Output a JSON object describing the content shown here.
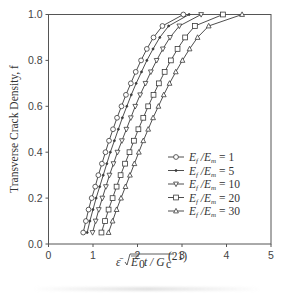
{
  "chart_data": {
    "type": "line",
    "title": "",
    "xlabel": "ε̄ √(Ē₀t / G_c^(21))",
    "ylabel": "Transverse Crack Density, f",
    "xlim": [
      0,
      5
    ],
    "ylim": [
      0.0,
      1.0
    ],
    "x_ticks": [
      "0",
      "1",
      "2",
      "3",
      "4",
      "5"
    ],
    "y_ticks": [
      "0.0",
      "0.2",
      "0.4",
      "0.6",
      "0.8",
      "1.0"
    ],
    "grid": false,
    "legend_position": "lower right (inside)",
    "y": [
      0.05,
      0.1,
      0.15,
      0.2,
      0.25,
      0.3,
      0.35,
      0.4,
      0.45,
      0.5,
      0.55,
      0.6,
      0.65,
      0.7,
      0.75,
      0.8,
      0.85,
      0.9,
      0.95,
      1.0
    ],
    "series": [
      {
        "name": "E_f/E_m = 1",
        "ratio": "1",
        "marker": "circle",
        "x": [
          0.78,
          0.84,
          0.9,
          0.97,
          1.05,
          1.12,
          1.2,
          1.28,
          1.36,
          1.45,
          1.54,
          1.64,
          1.74,
          1.85,
          1.96,
          2.08,
          2.21,
          2.36,
          2.56,
          3.03
        ]
      },
      {
        "name": "E_f/E_m = 5",
        "ratio": "5",
        "marker": "dot",
        "x": [
          0.87,
          0.93,
          1.0,
          1.07,
          1.15,
          1.23,
          1.31,
          1.39,
          1.48,
          1.57,
          1.66,
          1.76,
          1.86,
          1.97,
          2.09,
          2.21,
          2.35,
          2.5,
          2.7,
          3.16
        ]
      },
      {
        "name": "E_f/E_m = 10",
        "ratio": "10",
        "marker": "triangle-down",
        "x": [
          0.99,
          1.06,
          1.13,
          1.21,
          1.29,
          1.37,
          1.46,
          1.55,
          1.65,
          1.75,
          1.85,
          1.95,
          2.06,
          2.18,
          2.3,
          2.43,
          2.57,
          2.73,
          2.94,
          3.43
        ]
      },
      {
        "name": "E_f/E_m = 20",
        "ratio": "20",
        "marker": "square",
        "x": [
          1.19,
          1.27,
          1.35,
          1.44,
          1.53,
          1.62,
          1.72,
          1.82,
          1.92,
          2.02,
          2.13,
          2.24,
          2.36,
          2.48,
          2.61,
          2.75,
          2.9,
          3.07,
          3.29,
          3.92
        ]
      },
      {
        "name": "E_f/E_m = 30",
        "ratio": "30",
        "marker": "triangle-up",
        "x": [
          1.35,
          1.44,
          1.53,
          1.63,
          1.73,
          1.83,
          1.93,
          2.03,
          2.13,
          2.24,
          2.35,
          2.47,
          2.59,
          2.72,
          2.86,
          3.01,
          3.17,
          3.35,
          3.6,
          4.35
        ]
      }
    ]
  },
  "legend": {
    "prefix": "E",
    "items": [
      {
        "ratio": "1",
        "marker": "circle"
      },
      {
        "ratio": "5",
        "marker": "dot"
      },
      {
        "ratio": "10",
        "marker": "triangle-down"
      },
      {
        "ratio": "20",
        "marker": "square"
      },
      {
        "ratio": "30",
        "marker": "triangle-up"
      }
    ]
  },
  "colors": {
    "line": "#3a3a3a",
    "axis": "#555555",
    "marker_fill": "#ffffff"
  }
}
